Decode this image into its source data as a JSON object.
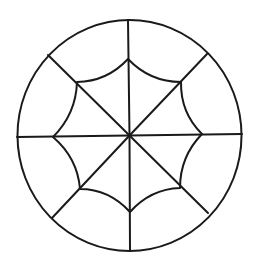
{
  "diagram": {
    "type": "radial-web",
    "canvas": {
      "width": 258,
      "height": 265,
      "background": "#ffffff"
    },
    "style": {
      "stroke": "#1a1a1a",
      "stroke_width": 2
    },
    "center": {
      "x": 129.5,
      "y": 135.5
    },
    "outer_circle": {
      "cx": 129.5,
      "cy": 135.5,
      "rx": 112,
      "ry": 115.5
    },
    "spokes": [
      {
        "name": "top",
        "x": 128,
        "y": 20
      },
      {
        "name": "upper-right",
        "x": 207,
        "y": 54
      },
      {
        "name": "right",
        "x": 242,
        "y": 134
      },
      {
        "name": "lower-right",
        "x": 208,
        "y": 213
      },
      {
        "name": "bottom",
        "x": 130,
        "y": 251
      },
      {
        "name": "lower-left",
        "x": 52,
        "y": 218
      },
      {
        "name": "left",
        "x": 17,
        "y": 137
      },
      {
        "name": "upper-left",
        "x": 48,
        "y": 55
      }
    ],
    "inner_web": {
      "vertices": [
        {
          "name": "top",
          "x": 128,
          "y": 59
        },
        {
          "name": "upper-right",
          "x": 181,
          "y": 82
        },
        {
          "name": "right",
          "x": 202,
          "y": 134
        },
        {
          "name": "lower-right",
          "x": 180,
          "y": 188
        },
        {
          "name": "bottom",
          "x": 130,
          "y": 212
        },
        {
          "name": "lower-left",
          "x": 80,
          "y": 189
        },
        {
          "name": "left",
          "x": 53,
          "y": 137
        },
        {
          "name": "upper-left",
          "x": 77,
          "y": 82
        }
      ],
      "edge_controls": [
        {
          "x": 150,
          "y": 82
        },
        {
          "x": 180.5,
          "y": 113
        },
        {
          "x": 180,
          "y": 156.5
        },
        {
          "x": 150.5,
          "y": 189
        },
        {
          "x": 109,
          "y": 189
        },
        {
          "x": 77.5,
          "y": 158
        },
        {
          "x": 76,
          "y": 114
        },
        {
          "x": 107,
          "y": 81.5
        }
      ]
    }
  }
}
